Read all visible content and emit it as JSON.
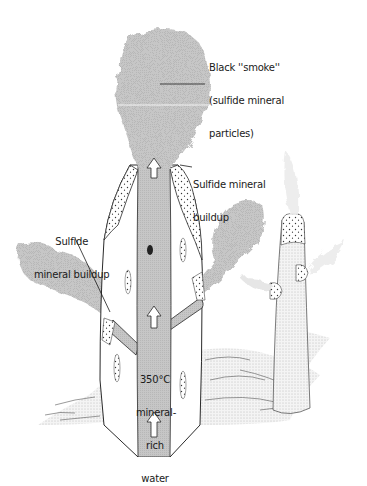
{
  "figure": {
    "labels": {
      "smoke": {
        "line1": "Black ''smoke''",
        "line2": "(sulfide mineral",
        "line3": "particles)"
      },
      "buildup_right": {
        "line1": "Sulfide mineral",
        "line2": "buildup"
      },
      "buildup_left": {
        "line1": "Sulfide",
        "line2": "mineral buildup"
      },
      "water": {
        "line1": "350°C",
        "line2": "mineral-",
        "line3": "rich",
        "line4": "water"
      }
    },
    "colors": {
      "conduit": "#c9c9c9",
      "plume": "#d2d2d2",
      "outline": "#2a2a2a",
      "background": "#ffffff"
    }
  }
}
